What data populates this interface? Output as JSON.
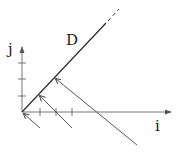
{
  "diagram": {
    "labels": {
      "vertical_axis": "j",
      "horizontal_axis": "i",
      "line": "D"
    },
    "colors": {
      "stroke": "#333333",
      "background": "#ffffff"
    },
    "origin": [
      22,
      112
    ],
    "horizontal_axis": {
      "from": [
        22,
        112
      ],
      "to": [
        171,
        112
      ],
      "ticks_x": [
        40,
        56,
        72
      ]
    },
    "vertical_axis": {
      "from": [
        22,
        112
      ],
      "to": [
        22,
        47
      ],
      "ticks_y": [
        96,
        79,
        63
      ]
    },
    "line_D": {
      "solid_from": [
        22,
        112
      ],
      "solid_to": [
        106,
        23
      ],
      "dashed_to": [
        119,
        9
      ]
    },
    "perpendicular_arrows": [
      {
        "from": [
          40,
          128
        ],
        "to": [
          24,
          114
        ]
      },
      {
        "from": [
          72,
          128
        ],
        "to": [
          40,
          96
        ]
      },
      {
        "from": [
          137,
          145
        ],
        "to": [
          56,
          79
        ]
      }
    ]
  }
}
